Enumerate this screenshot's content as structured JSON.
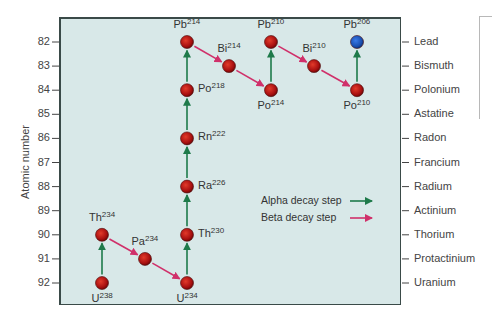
{
  "chart_data": {
    "type": "diagram",
    "ylabel": "Atomic number",
    "y_ticks": [
      82,
      83,
      84,
      85,
      86,
      87,
      88,
      89,
      90,
      91,
      92
    ],
    "y_inverted": true,
    "right_axis_elements": [
      "Lead",
      "Bismuth",
      "Polonium",
      "Astatine",
      "Radon",
      "Francium",
      "Radium",
      "Actinium",
      "Thorium",
      "Protactinium",
      "Uranium"
    ],
    "nodes": [
      {
        "id": "U238",
        "element": "U",
        "mass": "238",
        "atomic_number": 92,
        "col": 0,
        "label_pos": "below",
        "color": "#b01818"
      },
      {
        "id": "Th234",
        "element": "Th",
        "mass": "234",
        "atomic_number": 90,
        "col": 0,
        "label_pos": "above",
        "color": "#b01818"
      },
      {
        "id": "Pa234",
        "element": "Pa",
        "mass": "234",
        "atomic_number": 91,
        "col": 1,
        "label_pos": "above",
        "color": "#b01818"
      },
      {
        "id": "U234",
        "element": "U",
        "mass": "234",
        "atomic_number": 92,
        "col": 2,
        "label_pos": "below",
        "color": "#b01818"
      },
      {
        "id": "Th230",
        "element": "Th",
        "mass": "230",
        "atomic_number": 90,
        "col": 2,
        "label_pos": "right",
        "color": "#b01818"
      },
      {
        "id": "Ra226",
        "element": "Ra",
        "mass": "226",
        "atomic_number": 88,
        "col": 2,
        "label_pos": "right",
        "color": "#b01818"
      },
      {
        "id": "Rn222",
        "element": "Rn",
        "mass": "222",
        "atomic_number": 86,
        "col": 2,
        "label_pos": "right",
        "color": "#b01818"
      },
      {
        "id": "Po218",
        "element": "Po",
        "mass": "218",
        "atomic_number": 84,
        "col": 2,
        "label_pos": "right",
        "color": "#b01818"
      },
      {
        "id": "Pb214",
        "element": "Pb",
        "mass": "214",
        "atomic_number": 82,
        "col": 2,
        "label_pos": "above",
        "color": "#b01818"
      },
      {
        "id": "Bi214",
        "element": "Bi",
        "mass": "214",
        "atomic_number": 83,
        "col": 3,
        "label_pos": "above",
        "color": "#b01818"
      },
      {
        "id": "Po214",
        "element": "Po",
        "mass": "214",
        "atomic_number": 84,
        "col": 4,
        "label_pos": "below",
        "color": "#b01818"
      },
      {
        "id": "Pb210",
        "element": "Pb",
        "mass": "210",
        "atomic_number": 82,
        "col": 4,
        "label_pos": "above",
        "color": "#b01818"
      },
      {
        "id": "Bi210",
        "element": "Bi",
        "mass": "210",
        "atomic_number": 83,
        "col": 5,
        "label_pos": "above",
        "color": "#b01818"
      },
      {
        "id": "Po210",
        "element": "Po",
        "mass": "210",
        "atomic_number": 84,
        "col": 6,
        "label_pos": "below",
        "color": "#b01818"
      },
      {
        "id": "Pb206",
        "element": "Pb",
        "mass": "206",
        "atomic_number": 82,
        "col": 6,
        "label_pos": "above",
        "color": "#1a4fb0"
      }
    ],
    "steps": [
      {
        "from": "U238",
        "to": "Th234",
        "type": "alpha"
      },
      {
        "from": "Th234",
        "to": "Pa234",
        "type": "beta"
      },
      {
        "from": "Pa234",
        "to": "U234",
        "type": "beta"
      },
      {
        "from": "U234",
        "to": "Th230",
        "type": "alpha"
      },
      {
        "from": "Th230",
        "to": "Ra226",
        "type": "alpha"
      },
      {
        "from": "Ra226",
        "to": "Rn222",
        "type": "alpha"
      },
      {
        "from": "Rn222",
        "to": "Po218",
        "type": "alpha"
      },
      {
        "from": "Po218",
        "to": "Pb214",
        "type": "alpha"
      },
      {
        "from": "Pb214",
        "to": "Bi214",
        "type": "beta"
      },
      {
        "from": "Bi214",
        "to": "Po214",
        "type": "beta"
      },
      {
        "from": "Po214",
        "to": "Pb210",
        "type": "alpha"
      },
      {
        "from": "Pb210",
        "to": "Bi210",
        "type": "beta"
      },
      {
        "from": "Bi210",
        "to": "Po210",
        "type": "beta"
      },
      {
        "from": "Po210",
        "to": "Pb206",
        "type": "alpha"
      }
    ],
    "legend": [
      {
        "label": "Alpha decay step",
        "color": "#1e7a4a"
      },
      {
        "label": "Beta decay step",
        "color": "#d0306a"
      }
    ],
    "colors": {
      "plot_bg": "#d8e8e8",
      "alpha": "#1e7a4a",
      "beta": "#d0306a",
      "node_red": "#b01818",
      "node_blue": "#1a4fb0"
    }
  },
  "axis": {
    "ylabel": "Atomic number",
    "left_ticks": [
      "82",
      "83",
      "84",
      "85",
      "86",
      "87",
      "88",
      "89",
      "90",
      "91",
      "92"
    ],
    "right_labels": [
      "Lead",
      "Bismuth",
      "Polonium",
      "Astatine",
      "Radon",
      "Francium",
      "Radium",
      "Actinium",
      "Thorium",
      "Protactinium",
      "Uranium"
    ]
  },
  "legend": {
    "alpha_label": "Alpha decay step",
    "beta_label": "Beta decay step"
  }
}
